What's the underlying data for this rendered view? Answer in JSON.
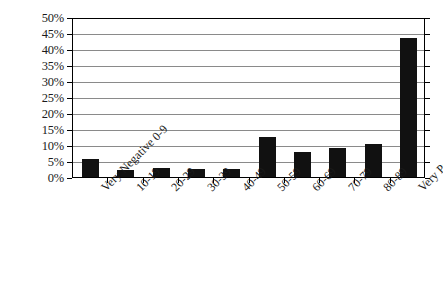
{
  "chart_data": {
    "type": "bar",
    "title": "",
    "subtitle": "",
    "xlabel": "",
    "ylabel": "",
    "categories": [
      "Very Negative 0-9",
      "10-19",
      "20-29",
      "30-39",
      "40-49",
      "50-59",
      "60-69",
      "70-79",
      "80-89",
      "Very Positive 90-100"
    ],
    "values": [
      5.5,
      2.3,
      2.9,
      2.4,
      2.5,
      12.4,
      7.8,
      9.0,
      10.2,
      43.5
    ],
    "value_unit": "%",
    "ylim": [
      0,
      50
    ],
    "ytick_step": 5,
    "ytick_labels": [
      "0%",
      "5%",
      "10%",
      "15%",
      "20%",
      "25%",
      "30%",
      "35%",
      "40%",
      "45%",
      "50%"
    ],
    "ytick_values": [
      0,
      5,
      10,
      15,
      20,
      25,
      30,
      35,
      40,
      45,
      50
    ],
    "grid": true,
    "grid_axis": "y",
    "legend": false,
    "legend_position": "none",
    "bar_color": "#111111",
    "gridline_color": "#8a8a8a",
    "frame_color": "#000000",
    "xtick_label_rotation": -45
  }
}
